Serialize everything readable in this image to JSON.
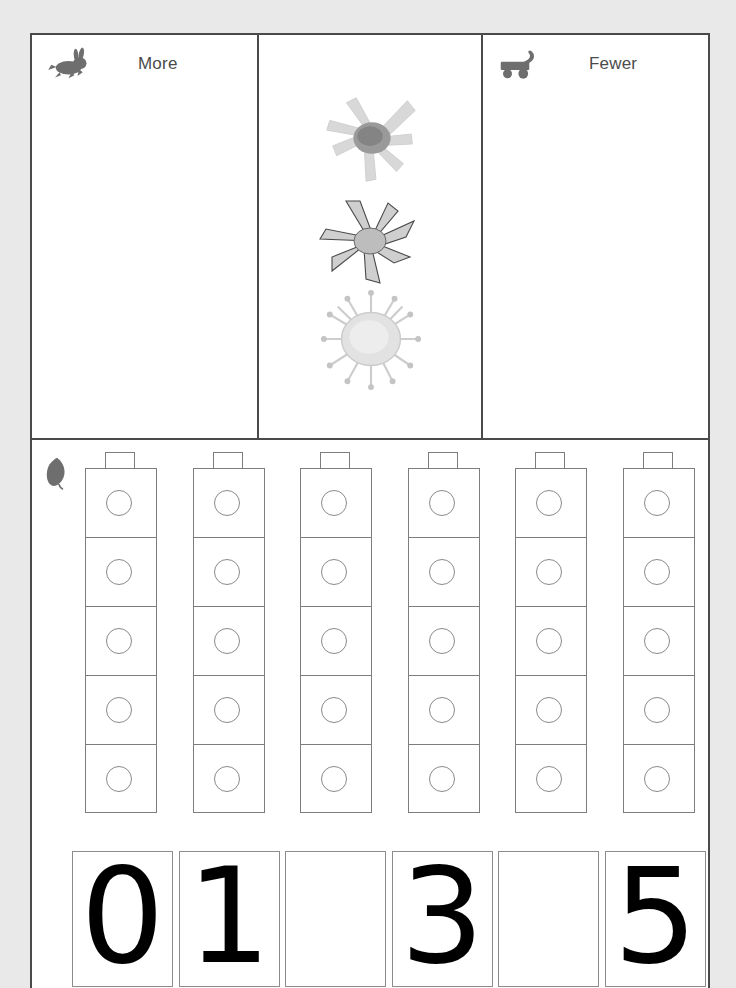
{
  "page": {
    "type": "math-worksheet",
    "background_color": "#e9e9e9",
    "page_color": "#ffffff",
    "border_color": "#4a4a4a"
  },
  "top_panels": [
    {
      "id": "more",
      "label": "More",
      "icon": "rabbit-icon",
      "icon_color": "#6e6e6e",
      "content": ""
    },
    {
      "id": "center",
      "label": "",
      "icon": "",
      "content": "three-grayscale-star-flower-images"
    },
    {
      "id": "fewer",
      "label": "Fewer",
      "icon": "wagon-icon",
      "icon_color": "#6e6e6e",
      "content": ""
    }
  ],
  "center_images": [
    {
      "name": "star-flower-image-1",
      "description": "pale gray star flower with radiating petals and dark center"
    },
    {
      "name": "star-flower-image-2",
      "description": "gray outlined star flower with pointed petals"
    },
    {
      "name": "spiky-seed-image-3",
      "description": "very pale round spiky seed burr"
    }
  ],
  "lower_section": {
    "icon": "leaf-icon",
    "icon_color": "#6e6e6e",
    "towers": {
      "count": 6,
      "cubes_per_tower": 5,
      "cube_marker": "circle",
      "has_top_nub": true,
      "outline_color": "#7d7d7d"
    },
    "number_boxes": [
      {
        "index": 1,
        "value": "0",
        "filled": true
      },
      {
        "index": 2,
        "value": "1",
        "filled": true
      },
      {
        "index": 3,
        "value": "",
        "filled": false
      },
      {
        "index": 4,
        "value": "3",
        "filled": true
      },
      {
        "index": 5,
        "value": "",
        "filled": false
      },
      {
        "index": 6,
        "value": "5",
        "filled": true
      }
    ]
  }
}
